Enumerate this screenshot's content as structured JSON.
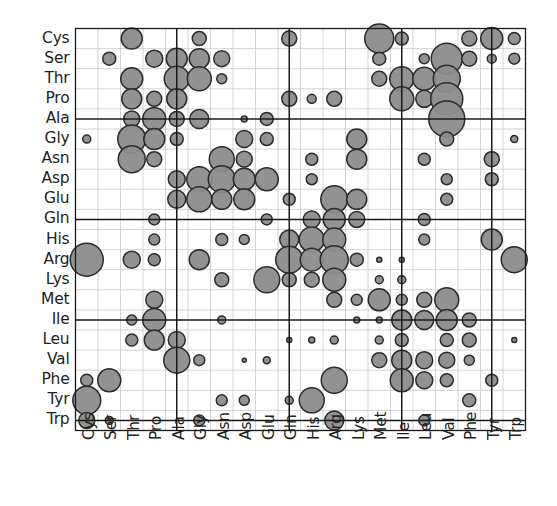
{
  "figure": {
    "type": "bubble-matrix",
    "background": "#ffffff",
    "bubble_fill": "#8c8c8c",
    "bubble_stroke": "#2b2b2b",
    "grid_minor_color": "#c9c9c9",
    "grid_major_color": "#1a1a1a",
    "axis_color": "#1a1a1a",
    "label_color": "#231f20"
  },
  "chart_data": {
    "type": "heatmap",
    "title": "",
    "subtitle": "",
    "xlabel": "",
    "ylabel": "",
    "grid": true,
    "legend": "none",
    "encoding": "Marker area encodes substitution / contact frequency between amino-acid pairs; larger circle = larger value.",
    "categories": [
      "Cys",
      "Ser",
      "Thr",
      "Pro",
      "Ala",
      "Gly",
      "Asn",
      "Asp",
      "Glu",
      "Gln",
      "His",
      "Arg",
      "Lys",
      "Met",
      "Ile",
      "Leu",
      "Val",
      "Phe",
      "Tyr",
      "Trp"
    ],
    "x_tick_labels": [
      "Cys",
      "Ser",
      "Thr",
      "Pro",
      "Ala",
      "Gly",
      "Asn",
      "Asp",
      "Glu",
      "Gln",
      "His",
      "Arg",
      "Lys",
      "Met",
      "Ile",
      "Leu",
      "Val",
      "Phe",
      "Tyr",
      "Trp"
    ],
    "y_tick_labels": [
      "Cys",
      "Ser",
      "Thr",
      "Pro",
      "Ala",
      "Gly",
      "Asn",
      "Asp",
      "Glu",
      "Gln",
      "His",
      "Arg",
      "Lys",
      "Met",
      "Ile",
      "Leu",
      "Val",
      "Phe",
      "Tyr",
      "Trp"
    ],
    "xlim": [
      0,
      20
    ],
    "ylim": [
      0,
      20
    ],
    "major_gridlines_x": [
      "Ala",
      "Gln",
      "Ile",
      "Tyr"
    ],
    "major_gridlines_y": [
      "Ala",
      "Gln",
      "Ile",
      "Trp"
    ],
    "size_range_px": [
      2,
      22
    ],
    "bubbles": [
      [
        2,
        0,
        10.5
      ],
      [
        5,
        0,
        7.0
      ],
      [
        9,
        0,
        7.5
      ],
      [
        13,
        0,
        14.5
      ],
      [
        14,
        0,
        6.5
      ],
      [
        17,
        0,
        7.5
      ],
      [
        18,
        0,
        11.0
      ],
      [
        19,
        0,
        6.0
      ],
      [
        1,
        1,
        6.5
      ],
      [
        3,
        1,
        8.5
      ],
      [
        4,
        1,
        10.5
      ],
      [
        5,
        1,
        10.0
      ],
      [
        6,
        1,
        8.0
      ],
      [
        13,
        1,
        6.5
      ],
      [
        15,
        1,
        5.0
      ],
      [
        16,
        1,
        15.5
      ],
      [
        17,
        1,
        7.5
      ],
      [
        18,
        1,
        4.5
      ],
      [
        19,
        1,
        5.5
      ],
      [
        2,
        2,
        11.0
      ],
      [
        4,
        2,
        12.5
      ],
      [
        5,
        2,
        12.0
      ],
      [
        6,
        2,
        5.0
      ],
      [
        13,
        2,
        7.5
      ],
      [
        14,
        2,
        12.0
      ],
      [
        15,
        2,
        11.5
      ],
      [
        16,
        2,
        13.5
      ],
      [
        2,
        3,
        10.0
      ],
      [
        3,
        3,
        7.5
      ],
      [
        4,
        3,
        10.0
      ],
      [
        9,
        3,
        7.5
      ],
      [
        10,
        3,
        4.5
      ],
      [
        11,
        3,
        7.5
      ],
      [
        14,
        3,
        12.0
      ],
      [
        15,
        3,
        8.5
      ],
      [
        16,
        3,
        16.0
      ],
      [
        2,
        4,
        8.0
      ],
      [
        3,
        4,
        11.5
      ],
      [
        4,
        4,
        7.5
      ],
      [
        5,
        4,
        9.5
      ],
      [
        7,
        4,
        3.0
      ],
      [
        8,
        4,
        6.5
      ],
      [
        16,
        4,
        18.0
      ],
      [
        0,
        5,
        4.0
      ],
      [
        2,
        5,
        14.0
      ],
      [
        3,
        5,
        10.5
      ],
      [
        4,
        5,
        6.5
      ],
      [
        7,
        5,
        8.5
      ],
      [
        8,
        5,
        6.5
      ],
      [
        12,
        5,
        10.0
      ],
      [
        16,
        5,
        7.0
      ],
      [
        19,
        5,
        3.5
      ],
      [
        2,
        6,
        13.5
      ],
      [
        3,
        6,
        7.5
      ],
      [
        6,
        6,
        12.5
      ],
      [
        7,
        6,
        8.0
      ],
      [
        10,
        6,
        6.0
      ],
      [
        12,
        6,
        10.0
      ],
      [
        15,
        6,
        6.0
      ],
      [
        18,
        6,
        7.5
      ],
      [
        4,
        7,
        8.5
      ],
      [
        5,
        7,
        12.5
      ],
      [
        6,
        7,
        13.5
      ],
      [
        7,
        7,
        11.0
      ],
      [
        8,
        7,
        11.5
      ],
      [
        10,
        7,
        5.5
      ],
      [
        16,
        7,
        5.5
      ],
      [
        18,
        7,
        6.5
      ],
      [
        4,
        8,
        9.0
      ],
      [
        5,
        8,
        12.5
      ],
      [
        6,
        8,
        10.0
      ],
      [
        7,
        8,
        10.5
      ],
      [
        9,
        8,
        6.0
      ],
      [
        11,
        8,
        13.5
      ],
      [
        12,
        8,
        10.0
      ],
      [
        16,
        8,
        6.0
      ],
      [
        3,
        9,
        5.5
      ],
      [
        8,
        9,
        5.5
      ],
      [
        10,
        9,
        8.5
      ],
      [
        11,
        9,
        11.0
      ],
      [
        12,
        9,
        8.0
      ],
      [
        15,
        9,
        6.0
      ],
      [
        3,
        10,
        5.5
      ],
      [
        6,
        10,
        6.0
      ],
      [
        7,
        10,
        5.0
      ],
      [
        9,
        10,
        9.5
      ],
      [
        10,
        10,
        12.5
      ],
      [
        11,
        10,
        11.5
      ],
      [
        15,
        10,
        5.5
      ],
      [
        18,
        10,
        10.5
      ],
      [
        0,
        11,
        16.5
      ],
      [
        2,
        11,
        8.5
      ],
      [
        3,
        11,
        3.0
      ],
      [
        3,
        11,
        6.0
      ],
      [
        5,
        11,
        10.0
      ],
      [
        9,
        11,
        13.5
      ],
      [
        10,
        11,
        11.5
      ],
      [
        11,
        11,
        14.0
      ],
      [
        12,
        11,
        6.5
      ],
      [
        13,
        11,
        2.5
      ],
      [
        14,
        11,
        2.5
      ],
      [
        19,
        11,
        13.0
      ],
      [
        6,
        12,
        7.0
      ],
      [
        8,
        12,
        13.0
      ],
      [
        9,
        12,
        7.0
      ],
      [
        10,
        12,
        7.5
      ],
      [
        11,
        12,
        11.5
      ],
      [
        13,
        12,
        4.0
      ],
      [
        14,
        12,
        4.0
      ],
      [
        3,
        13,
        8.5
      ],
      [
        11,
        13,
        7.5
      ],
      [
        12,
        13,
        5.5
      ],
      [
        13,
        13,
        11.0
      ],
      [
        14,
        13,
        5.5
      ],
      [
        15,
        13,
        7.5
      ],
      [
        16,
        13,
        12.0
      ],
      [
        2,
        14,
        5.0
      ],
      [
        3,
        14,
        11.5
      ],
      [
        6,
        14,
        4.0
      ],
      [
        12,
        14,
        3.0
      ],
      [
        13,
        14,
        3.0
      ],
      [
        14,
        14,
        10.0
      ],
      [
        15,
        14,
        9.5
      ],
      [
        16,
        14,
        10.5
      ],
      [
        17,
        14,
        7.0
      ],
      [
        2,
        15,
        6.0
      ],
      [
        3,
        15,
        10.0
      ],
      [
        4,
        15,
        8.5
      ],
      [
        9,
        15,
        2.5
      ],
      [
        10,
        15,
        3.0
      ],
      [
        11,
        15,
        4.0
      ],
      [
        13,
        15,
        4.0
      ],
      [
        14,
        15,
        6.5
      ],
      [
        16,
        15,
        6.5
      ],
      [
        17,
        15,
        7.0
      ],
      [
        19,
        15,
        2.5
      ],
      [
        4,
        16,
        13.0
      ],
      [
        5,
        16,
        5.5
      ],
      [
        7,
        16,
        2.0
      ],
      [
        8,
        16,
        3.5
      ],
      [
        13,
        16,
        7.5
      ],
      [
        14,
        16,
        10.0
      ],
      [
        15,
        16,
        8.5
      ],
      [
        16,
        16,
        8.0
      ],
      [
        17,
        16,
        5.0
      ],
      [
        0,
        17,
        6.0
      ],
      [
        1,
        17,
        11.5
      ],
      [
        11,
        17,
        13.0
      ],
      [
        14,
        17,
        11.5
      ],
      [
        15,
        17,
        8.5
      ],
      [
        16,
        17,
        6.5
      ],
      [
        18,
        17,
        6.0
      ],
      [
        0,
        18,
        14.0
      ],
      [
        6,
        18,
        5.5
      ],
      [
        7,
        18,
        5.0
      ],
      [
        9,
        18,
        4.0
      ],
      [
        10,
        18,
        12.5
      ],
      [
        17,
        18,
        6.5
      ],
      [
        0,
        19,
        8.0
      ],
      [
        1,
        19,
        4.0
      ],
      [
        5,
        19,
        5.5
      ],
      [
        11,
        19,
        9.5
      ],
      [
        15,
        19,
        5.5
      ]
    ]
  },
  "axes": {
    "x_axis_name": "x-axis-amino-acids",
    "y_axis_name": "y-axis-amino-acids"
  }
}
